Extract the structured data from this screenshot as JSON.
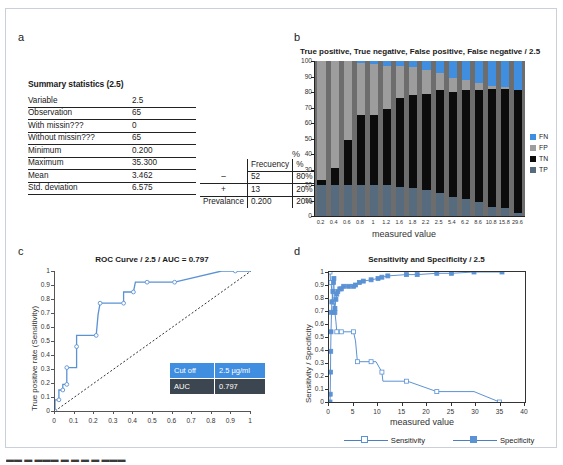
{
  "figure": {
    "panel_letters": {
      "a": "a",
      "b": "b",
      "c": "c",
      "d": "d"
    },
    "caption_clipped": "▬▬  ▬  ▬▬▬ ▬  ▬ ▬ ▬ ▬▬▬"
  },
  "colors": {
    "FN": "#3f8ee0",
    "FP": "#9d9d9d",
    "TN": "#0c0c0c",
    "TP": "#566b7d",
    "curve_blue": "#5b92d4",
    "box_blue": "#3f8ee0",
    "box_dark": "#3c4650",
    "plot_bg": "#6d6d6d"
  },
  "panel_a": {
    "title": "Summary statistics (2.5)",
    "stats_rows": [
      {
        "label": "Variable",
        "value": "2.5"
      },
      {
        "label": "Observation",
        "value": "65"
      },
      {
        "label": "With missin???",
        "value": "0"
      },
      {
        "label": "Without missin???",
        "value": "65"
      },
      {
        "label": "Minimum",
        "value": "0.200"
      },
      {
        "label": "Maximum",
        "value": "35.300"
      },
      {
        "label": "Mean",
        "value": "3.462"
      },
      {
        "label": "Std. deviation",
        "value": "6.575"
      }
    ],
    "freq_table": {
      "headers": [
        "",
        "Frecuency",
        "%"
      ],
      "rows": [
        [
          "–",
          "52",
          "80%"
        ],
        [
          "+",
          "13",
          "20%"
        ],
        [
          "Prevalance",
          "0.200",
          "20%"
        ]
      ]
    }
  },
  "chart_data": [
    {
      "panel": "b",
      "type": "bar",
      "stacked": true,
      "title": "True positive, True negative, False positive, False negative / 2.5",
      "xlabel": "measured value",
      "ylabel": "%",
      "ylim": [
        0,
        100
      ],
      "yticks": [
        0,
        10,
        20,
        30,
        40,
        50,
        60,
        70,
        80,
        90,
        100
      ],
      "grid": false,
      "legend_position": "right",
      "legend": [
        "FN",
        "FP",
        "TN",
        "TP"
      ],
      "categories": [
        "0.2",
        "0.4",
        "0.6",
        "0.8",
        "1",
        "1.2",
        "1.6",
        "1.8",
        "2.2",
        "2.5",
        "5.4",
        "6.2",
        "8.6",
        "10.8",
        "15.8",
        "29.6"
      ],
      "series": [
        {
          "name": "TP",
          "values": [
            20,
            20,
            20,
            20,
            20,
            20,
            19,
            18,
            17,
            15,
            12,
            11,
            9,
            6,
            5,
            2
          ]
        },
        {
          "name": "TN",
          "values": [
            3,
            11,
            29,
            45,
            45,
            49,
            57,
            60,
            62,
            66,
            68,
            70,
            72,
            76,
            77,
            79
          ]
        },
        {
          "name": "FP",
          "values": [
            77,
            69,
            51,
            34,
            33,
            28,
            21,
            18,
            15,
            11,
            9,
            7,
            5,
            2,
            1,
            0
          ]
        },
        {
          "name": "FN",
          "values": [
            0,
            0,
            0,
            1,
            2,
            3,
            3,
            4,
            6,
            8,
            11,
            12,
            14,
            16,
            17,
            19
          ]
        }
      ]
    },
    {
      "panel": "c",
      "type": "line",
      "title": "ROC Curve / 2.5 / AUC = 0.797",
      "xlabel": "",
      "ylabel": "True positive rate (Sensitivity)",
      "xlim": [
        0,
        1
      ],
      "ylim": [
        0,
        1
      ],
      "xticks": [
        "0",
        "0.1",
        "0.2",
        "0.3",
        "0.4",
        "0.5",
        "0.6",
        "0.7",
        "0.8",
        "0.9",
        "1"
      ],
      "yticks": [
        "0",
        "0.1",
        "0.2",
        "0.3",
        "0.4",
        "0.5",
        "0.6",
        "0.7",
        "0.8",
        "0.9",
        "1"
      ],
      "grid": false,
      "reference_line": "diagonal y=x dashed",
      "points": [
        [
          0.0,
          0.0
        ],
        [
          0.0,
          0.08
        ],
        [
          0.02,
          0.08
        ],
        [
          0.02,
          0.15
        ],
        [
          0.04,
          0.15
        ],
        [
          0.04,
          0.19
        ],
        [
          0.06,
          0.19
        ],
        [
          0.06,
          0.23
        ],
        [
          0.06,
          0.31
        ],
        [
          0.11,
          0.31
        ],
        [
          0.11,
          0.46
        ],
        [
          0.11,
          0.54
        ],
        [
          0.21,
          0.54
        ],
        [
          0.22,
          0.69
        ],
        [
          0.23,
          0.77
        ],
        [
          0.31,
          0.77
        ],
        [
          0.35,
          0.77
        ],
        [
          0.35,
          0.85
        ],
        [
          0.4,
          0.85
        ],
        [
          0.41,
          0.92
        ],
        [
          0.47,
          0.92
        ],
        [
          0.54,
          0.92
        ],
        [
          0.61,
          0.92
        ],
        [
          0.85,
          1.0
        ],
        [
          0.92,
          1.0
        ],
        [
          1.0,
          1.0
        ]
      ],
      "annotation_table": {
        "rows": [
          {
            "label": "Cut off",
            "value": "2.5 µg/ml",
            "style": "blue"
          },
          {
            "label": "AUC",
            "value": "0.797",
            "style": "dark"
          }
        ]
      }
    },
    {
      "panel": "d",
      "type": "line",
      "title": "Sensitivity and Specificity / 2.5",
      "xlabel": "measured value",
      "ylabel": "Sensitivity / Specificity",
      "xlim": [
        0,
        40
      ],
      "ylim": [
        0,
        1
      ],
      "xticks": [
        "0",
        "5",
        "10",
        "15",
        "20",
        "25",
        "30",
        "35",
        "40"
      ],
      "yticks": [
        "0",
        "0.1",
        "0.2",
        "0.3",
        "0.4",
        "0.5",
        "0.6",
        "0.7",
        "0.8",
        "0.9",
        "1"
      ],
      "grid": false,
      "legend_position": "bottom",
      "legend": [
        "Sensitivity",
        "Specificity"
      ],
      "series": [
        {
          "name": "Sensitivity",
          "marker": "open-square",
          "points": [
            [
              0.2,
              1.0
            ],
            [
              0.3,
              0.92
            ],
            [
              0.4,
              0.92
            ],
            [
              0.6,
              0.85
            ],
            [
              0.8,
              0.77
            ],
            [
              1.0,
              0.77
            ],
            [
              1.2,
              0.69
            ],
            [
              1.4,
              0.62
            ],
            [
              1.6,
              0.54
            ],
            [
              2.2,
              0.54
            ],
            [
              2.5,
              0.54
            ],
            [
              4.8,
              0.54
            ],
            [
              5.0,
              0.54
            ],
            [
              5.4,
              0.47
            ],
            [
              5.8,
              0.31
            ],
            [
              6.2,
              0.31
            ],
            [
              8.6,
              0.31
            ],
            [
              9.6,
              0.31
            ],
            [
              10.8,
              0.23
            ],
            [
              11.0,
              0.16
            ],
            [
              15.8,
              0.16
            ],
            [
              16.0,
              0.16
            ],
            [
              22.0,
              0.08
            ],
            [
              29.6,
              0.08
            ],
            [
              34.8,
              0.0
            ],
            [
              35.3,
              0.0
            ]
          ]
        },
        {
          "name": "Specificity",
          "marker": "filled-square",
          "points": [
            [
              0.2,
              0.0
            ],
            [
              0.25,
              0.06
            ],
            [
              0.3,
              0.23
            ],
            [
              0.35,
              0.39
            ],
            [
              0.4,
              0.54
            ],
            [
              0.5,
              0.69
            ],
            [
              0.6,
              0.77
            ],
            [
              0.8,
              0.85
            ],
            [
              0.9,
              0.92
            ],
            [
              1.0,
              0.95
            ],
            [
              1.1,
              0.69
            ],
            [
              1.2,
              0.72
            ],
            [
              1.4,
              0.79
            ],
            [
              1.6,
              0.83
            ],
            [
              1.8,
              0.85
            ],
            [
              2.2,
              0.87
            ],
            [
              2.5,
              0.87
            ],
            [
              3.0,
              0.89
            ],
            [
              4.0,
              0.89
            ],
            [
              5.0,
              0.89
            ],
            [
              5.4,
              0.9
            ],
            [
              6.2,
              0.92
            ],
            [
              7.0,
              0.93
            ],
            [
              8.6,
              0.94
            ],
            [
              10.0,
              0.95
            ],
            [
              10.8,
              0.96
            ],
            [
              12.0,
              0.97
            ],
            [
              15.8,
              0.98
            ],
            [
              18.0,
              0.98
            ],
            [
              22.0,
              0.99
            ],
            [
              25.0,
              0.99
            ],
            [
              29.6,
              1.0
            ],
            [
              35.3,
              1.0
            ]
          ]
        }
      ]
    }
  ]
}
